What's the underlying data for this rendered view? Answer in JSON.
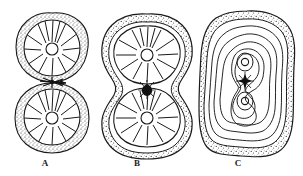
{
  "figure": {
    "background_color": "#ffffff",
    "ink_color": "#1a1a1a",
    "stipple_color": "#3a3a3a",
    "width": 303,
    "height": 176
  },
  "panels": [
    {
      "id": "A",
      "label": "A",
      "label_x": 45,
      "label_y": 163,
      "caption": "Two daughter cells, each with a radial spoked chromatophore, separating; connected by a narrow dark isthmus",
      "center_x": 52,
      "top_cell_center": {
        "x": 52,
        "y": 48
      },
      "bottom_cell_center": {
        "x": 52,
        "y": 117
      },
      "cell_radius": 35,
      "spoke_count": 14,
      "hub_radius": 6,
      "junction": {
        "x": 52,
        "y": 82,
        "type": "dark-isthmus"
      },
      "wall_texture": "stippled",
      "wall_thickness": 7
    },
    {
      "id": "B",
      "label": "B",
      "label_x": 137,
      "label_y": 163,
      "caption": "Single dumbbell-shaped cell with two spoked chromatophores joined at a constricted waist bearing a dark spindle",
      "center_x": 147,
      "top_cell_center": {
        "x": 147,
        "y": 52
      },
      "bottom_cell_center": {
        "x": 147,
        "y": 113
      },
      "cell_radius_x": 34,
      "cell_radius_y": 31,
      "spoke_count": 14,
      "hub_radius": 6,
      "waist": {
        "x": 147,
        "y": 83,
        "type": "dark-spindle"
      },
      "wall_texture": "stippled",
      "wall_thickness": 8
    },
    {
      "id": "C",
      "label": "C",
      "label_x": 238,
      "label_y": 163,
      "caption": "Optical section showing nested concentric contours converging on a figure-eight inner body with two nuclei and a central dark spindle",
      "center_x": 247,
      "center_y": 82,
      "outline_radius_x": 47,
      "outline_radius_y": 71,
      "contour_count": 6,
      "nuclei": [
        {
          "x": 245,
          "y": 62,
          "r": 4
        },
        {
          "x": 245,
          "y": 101,
          "r": 4
        }
      ],
      "spindle": {
        "x": 245,
        "y": 81,
        "type": "dark-star"
      },
      "wall_texture": "stippled",
      "wall_thickness": 8
    }
  ],
  "labels": {
    "a": "A",
    "b": "B",
    "c": "C"
  }
}
